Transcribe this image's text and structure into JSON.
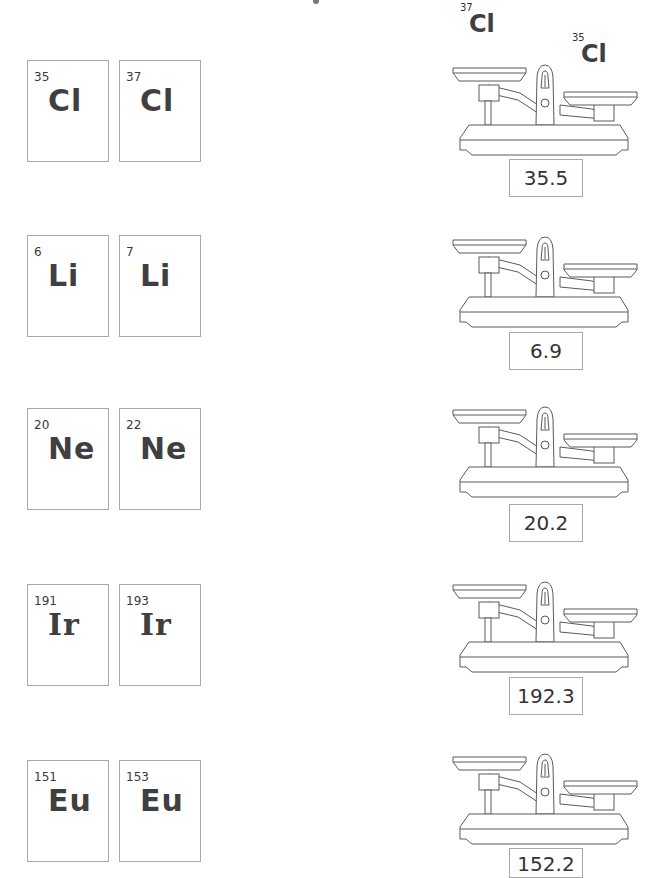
{
  "worksheet": {
    "top_fragment": "",
    "example_floating_isotopes": [
      {
        "mass": "37",
        "symbol": "Cl"
      },
      {
        "mass": "35",
        "symbol": "Cl"
      }
    ],
    "rows": [
      {
        "element": "Cl",
        "isotopes": [
          {
            "mass": "35",
            "symbol": "Cl"
          },
          {
            "mass": "37",
            "symbol": "Cl"
          }
        ],
        "relative_atomic_mass": "35.5"
      },
      {
        "element": "Li",
        "isotopes": [
          {
            "mass": "6",
            "symbol": "Li"
          },
          {
            "mass": "7",
            "symbol": "Li"
          }
        ],
        "relative_atomic_mass": "6.9"
      },
      {
        "element": "Ne",
        "isotopes": [
          {
            "mass": "20",
            "symbol": "Ne"
          },
          {
            "mass": "22",
            "symbol": "Ne"
          }
        ],
        "relative_atomic_mass": "20.2"
      },
      {
        "element": "Ir",
        "isotopes": [
          {
            "mass": "191",
            "symbol": "Ir"
          },
          {
            "mass": "193",
            "symbol": "Ir"
          }
        ],
        "relative_atomic_mass": "192.3"
      },
      {
        "element": "Eu",
        "isotopes": [
          {
            "mass": "151",
            "symbol": "Eu"
          },
          {
            "mass": "153",
            "symbol": "Eu"
          }
        ],
        "relative_atomic_mass": "152.2"
      }
    ]
  },
  "colors": {
    "line": "#5a5a5a",
    "border": "#a9a9a9",
    "text": "#3a3a3a"
  }
}
